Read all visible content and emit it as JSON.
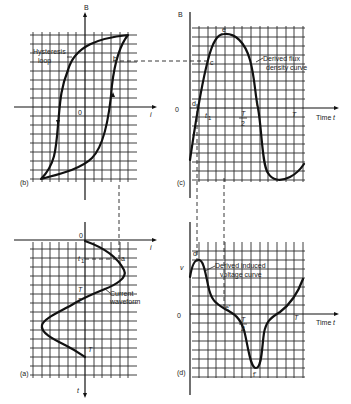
{
  "figure": {
    "panels": {
      "b": {
        "tag": "(b)",
        "y_axis_label": "B",
        "x_axis_label": "i",
        "origin_label": "0",
        "annotation": [
          "Hysteresis",
          "loop"
        ],
        "point_labels": [
          "b"
        ]
      },
      "c": {
        "tag": "(c)",
        "y_axis_label": "B",
        "x_axis_label": "Time t",
        "origin_label": "0",
        "annotation": [
          "Derived flux",
          "density curve"
        ],
        "point_labels": [
          "c",
          "d",
          "e",
          "f"
        ],
        "tick_labels": [
          "t1",
          "T/2",
          "T"
        ]
      },
      "a": {
        "tag": "(a)",
        "y_axis_label": "t",
        "x_axis_label": "i",
        "origin_label": "0",
        "annotation": [
          "Current",
          "waveform"
        ],
        "point_labels": [
          "a"
        ],
        "tick_labels": [
          "t1",
          "T/2",
          "T"
        ]
      },
      "d": {
        "tag": "(d)",
        "y_axis_label": "v",
        "x_axis_label": "Time t",
        "origin_label": "0",
        "annotation": [
          "Derived induced",
          "voltage curve"
        ],
        "point_labels": [
          "d'",
          "e'",
          "f'"
        ],
        "tick_labels": [
          "T/2",
          "T"
        ]
      }
    }
  },
  "text": {
    "b_tag": "(b)",
    "b_B": "B",
    "b_i": "i",
    "b_0": "0",
    "b_ann1": "Hysteresis",
    "b_ann2": "loop",
    "b_pt": "b",
    "c_tag": "(c)",
    "c_B": "B",
    "c_time": "Time",
    "c_t": "t",
    "c_0": "0",
    "c_ann1": "Derived flux",
    "c_ann2": "density curve",
    "c_pc": "c",
    "c_pd": "d",
    "c_pe": "e",
    "c_pf": "f",
    "c_t1": "t",
    "c_t1sub": "1",
    "c_Th": "T",
    "c_2": "2",
    "c_T": "T",
    "a_tag": "(a)",
    "a_t": "t",
    "a_i": "i",
    "a_0": "0",
    "a_ann1": "Current",
    "a_ann2": "waveform",
    "a_pa": "a",
    "a_t1": "t",
    "a_t1sub": "1",
    "a_Th": "T",
    "a_2": "2",
    "a_T": "T",
    "d_tag": "(d)",
    "d_v": "v",
    "d_time": "Time",
    "d_t": "t",
    "d_0": "0",
    "d_ann1": "Derived induced",
    "d_ann2": "voltage curve",
    "d_pd": "d'",
    "d_pe": "e'",
    "d_pf": "f'",
    "d_Th": "T",
    "d_2": "2",
    "d_T": "T"
  }
}
